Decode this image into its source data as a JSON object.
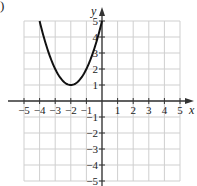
{
  "panel_label": ")",
  "chart_data": {
    "type": "line",
    "title": "",
    "xlabel": "x",
    "ylabel": "y",
    "xlim": [
      -5,
      5
    ],
    "ylim": [
      -5,
      5
    ],
    "grid": true,
    "x_ticks": [
      -5,
      -4,
      -3,
      -2,
      -1,
      1,
      2,
      3,
      4,
      5
    ],
    "y_ticks": [
      -5,
      -4,
      -3,
      -2,
      -1,
      1,
      2,
      3,
      4,
      5
    ],
    "series": [
      {
        "name": "y = (x + 2)^2 + 1",
        "x": [
          -4,
          -3.5,
          -3,
          -2.5,
          -2,
          -1.5,
          -1,
          -0.5,
          0
        ],
        "y": [
          5,
          3.25,
          2,
          1.25,
          1,
          1.25,
          2,
          3.25,
          5
        ]
      }
    ],
    "vertex": [
      -2,
      1
    ],
    "colors": {
      "grid": "#cfcfcf",
      "axis": "#333333",
      "curve": "#111111"
    }
  }
}
